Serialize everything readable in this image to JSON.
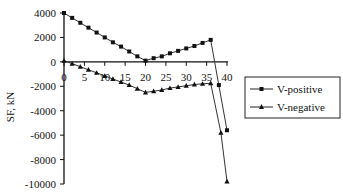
{
  "chart_data": {
    "type": "line",
    "title": "",
    "xlabel": "",
    "ylabel": "SF, kN",
    "xlim": [
      0,
      40
    ],
    "ylim": [
      -10000,
      4000
    ],
    "x_ticks": [
      0,
      5,
      10,
      15,
      20,
      25,
      30,
      35,
      40
    ],
    "y_ticks": [
      4000,
      2000,
      0,
      -2000,
      -4000,
      -6000,
      -8000,
      -10000
    ],
    "grid": false,
    "legend_position": "right",
    "series": [
      {
        "name": "V-positive",
        "marker": "square",
        "x": [
          0,
          2,
          4,
          6,
          8,
          10,
          12,
          14,
          16,
          18,
          20,
          22,
          24,
          26,
          28,
          30,
          32,
          34,
          36,
          38,
          40
        ],
        "y": [
          4000,
          3600,
          3200,
          2800,
          2400,
          2000,
          1600,
          1250,
          850,
          450,
          100,
          300,
          450,
          700,
          900,
          1100,
          1300,
          1550,
          1800,
          -1900,
          -5600
        ]
      },
      {
        "name": "V-negative",
        "marker": "triangle",
        "x": [
          0,
          2,
          4,
          6,
          8,
          10,
          12,
          14,
          16,
          18,
          20,
          22,
          24,
          26,
          28,
          30,
          32,
          34,
          36,
          38.5,
          40
        ],
        "y": [
          100,
          -150,
          -400,
          -650,
          -900,
          -1150,
          -1400,
          -1650,
          -1900,
          -2200,
          -2500,
          -2400,
          -2300,
          -2150,
          -2050,
          -1950,
          -1850,
          -1800,
          -1750,
          -5800,
          -9800
        ]
      }
    ]
  },
  "legend": {
    "items": [
      {
        "label": "V-positive",
        "marker": "square"
      },
      {
        "label": "V-negative",
        "marker": "triangle"
      }
    ]
  },
  "colors": {
    "line": "#111111",
    "series_line": "#333333",
    "background": "#ffffff"
  }
}
